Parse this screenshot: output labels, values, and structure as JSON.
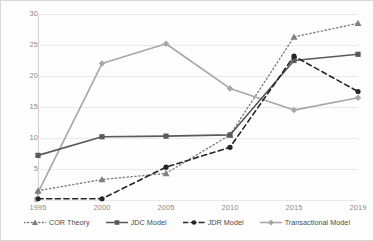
{
  "chart_data": {
    "type": "line",
    "title": "",
    "xlabel": "",
    "ylabel": "",
    "categories": [
      "1995",
      "2000",
      "2005",
      "2010",
      "2015",
      "2019"
    ],
    "ylim": [
      0,
      30
    ],
    "yticks": [
      0,
      5,
      10,
      15,
      20,
      25,
      30
    ],
    "grid": true,
    "legend_position": "bottom",
    "series": [
      {
        "name": "COR Theory",
        "values": [
          1.5,
          3.3,
          4.3,
          10.5,
          26.3,
          28.5
        ],
        "line_style": "dotted",
        "marker": "triangle",
        "color": "#7f7f7f"
      },
      {
        "name": "JDC Model",
        "values": [
          7.2,
          10.2,
          10.3,
          10.5,
          22.5,
          23.5
        ],
        "line_style": "solid",
        "marker": "square",
        "color": "#595959"
      },
      {
        "name": "JDR Model",
        "values": [
          0.2,
          0.2,
          5.3,
          8.5,
          23.2,
          17.5
        ],
        "line_style": "dashed",
        "marker": "circle",
        "color": "#262626"
      },
      {
        "name": "Transactional Model",
        "values": [
          1.2,
          22.0,
          25.2,
          18.0,
          14.5,
          16.5
        ],
        "line_style": "solid",
        "marker": "diamond",
        "color": "#a6a6a6"
      }
    ]
  },
  "axes": {
    "y_labels": [
      "30",
      "25",
      "20",
      "15",
      "10",
      "5",
      "0"
    ],
    "x_labels": [
      "1995",
      "2000",
      "2005",
      "2010",
      "2015",
      "2019"
    ]
  },
  "legend": {
    "items": [
      {
        "label": "COR Theory"
      },
      {
        "label": "JDC Model"
      },
      {
        "label": "JDR Model"
      },
      {
        "label": "Transactional Model"
      }
    ]
  }
}
